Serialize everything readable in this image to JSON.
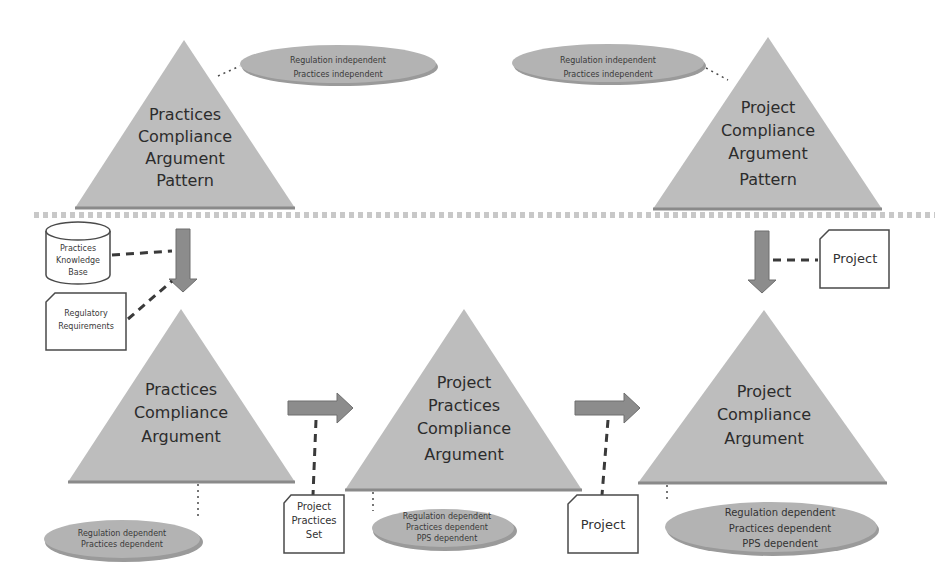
{
  "colors": {
    "triangle_fill": "#bdbdbd",
    "ellipse_fill": "#b3b3b3",
    "arrow_fill": "#8c8c8c",
    "box_stroke": "#4a4a4a",
    "separator": "#c8c8c8"
  },
  "top_row": {
    "practices_pattern": {
      "lines": [
        "Practices",
        "Compliance",
        "Argument",
        "Pattern"
      ],
      "note": [
        "Regulation independent",
        "Practices independent"
      ]
    },
    "project_pattern": {
      "lines": [
        "Project",
        "Compliance",
        "Argument",
        "Pattern"
      ],
      "note": [
        "Regulation independent",
        "Practices independent"
      ]
    }
  },
  "inputs": {
    "knowledge_base": [
      "Practices",
      "Knowledge",
      "Base"
    ],
    "regulatory": [
      "Regulatory",
      "Requirements"
    ],
    "project_top": "Project",
    "project_practices_set": [
      "Project",
      "Practices",
      "Set"
    ],
    "project_bottom": "Project"
  },
  "bottom_row": {
    "practices_argument": {
      "lines": [
        "Practices",
        "Compliance",
        "Argument"
      ],
      "note": [
        "Regulation dependent",
        "Practices dependent"
      ]
    },
    "project_practices_argument": {
      "lines": [
        "Project",
        "Practices",
        "Compliance",
        "Argument"
      ],
      "note": [
        "Regulation dependent",
        "Practices dependent",
        "PPS dependent"
      ]
    },
    "project_argument": {
      "lines": [
        "Project",
        "Compliance",
        "Argument"
      ],
      "note": [
        "Regulation dependent",
        "Practices dependent",
        "PPS dependent"
      ]
    }
  }
}
